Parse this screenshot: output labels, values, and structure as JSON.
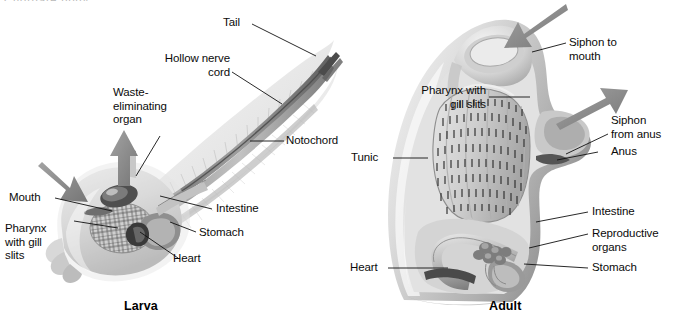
{
  "figure": {
    "title_fragment": "Chordate body",
    "background_color": "#ffffff",
    "ink_color": "#0b0b0b",
    "arrow_color": "#8c8c8c",
    "body_light": "#e8e8e8",
    "body_mid": "#b5b5b5",
    "body_dark": "#6f6f6f"
  },
  "panels": [
    {
      "id": "larva",
      "caption": "Larva",
      "labels": [
        {
          "name": "tail",
          "text": "Tail"
        },
        {
          "name": "hollow-nerve-cord",
          "text": "Hollow nerve\ncord"
        },
        {
          "name": "waste-eliminating-organ",
          "text": "Waste-\neliminating\norgan"
        },
        {
          "name": "notochord",
          "text": "Notochord"
        },
        {
          "name": "mouth",
          "text": "Mouth"
        },
        {
          "name": "pharynx-with-gill-slits",
          "text": "Pharynx\nwith gill\nslits"
        },
        {
          "name": "intestine",
          "text": "Intestine"
        },
        {
          "name": "stomach",
          "text": "Stomach"
        },
        {
          "name": "heart",
          "text": "Heart"
        }
      ],
      "arrows": [
        {
          "name": "water-in-arrow",
          "direction": "down-right"
        },
        {
          "name": "waste-out-arrow",
          "direction": "up"
        }
      ]
    },
    {
      "id": "adult",
      "caption": "Adult",
      "labels": [
        {
          "name": "siphon-to-mouth",
          "text": "Siphon to\nmouth"
        },
        {
          "name": "pharynx-with-gill-slits",
          "text": "Pharynx with\ngill slits"
        },
        {
          "name": "tunic",
          "text": "Tunic"
        },
        {
          "name": "siphon-from-anus",
          "text": "Siphon\nfrom anus"
        },
        {
          "name": "anus",
          "text": "Anus"
        },
        {
          "name": "intestine",
          "text": "Intestine"
        },
        {
          "name": "reproductive-organs",
          "text": "Reproductive\norgans"
        },
        {
          "name": "stomach",
          "text": "Stomach"
        },
        {
          "name": "heart",
          "text": "Heart"
        }
      ],
      "arrows": [
        {
          "name": "siphon-in-arrow",
          "direction": "down-left"
        },
        {
          "name": "siphon-out-arrow",
          "direction": "up-right"
        }
      ]
    }
  ],
  "larva_labels": {
    "tail": "Tail",
    "nerve_cord": "Hollow nerve\ncord",
    "waste_organ": "Waste-\neliminating\norgan",
    "notochord": "Notochord",
    "mouth": "Mouth",
    "pharynx": "Pharynx\nwith gill\nslits",
    "intestine": "Intestine",
    "stomach": "Stomach",
    "heart": "Heart",
    "caption": "Larva"
  },
  "adult_labels": {
    "siphon_mouth": "Siphon to\nmouth",
    "pharynx": "Pharynx with\ngill slits",
    "tunic": "Tunic",
    "siphon_anus": "Siphon\nfrom anus",
    "anus": "Anus",
    "intestine": "Intestine",
    "reproductive": "Reproductive\norgans",
    "stomach": "Stomach",
    "heart": "Heart",
    "caption": "Adult"
  },
  "cropped_header": "Chordate body"
}
